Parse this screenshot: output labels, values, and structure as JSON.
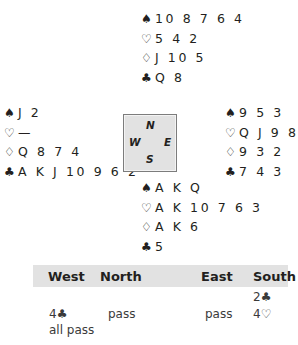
{
  "suits": {
    "spades": "♠",
    "hearts": "♡",
    "diamonds": "♢",
    "clubs": "♣"
  },
  "hands": {
    "north": {
      "spades": "10 8 7 6 4",
      "hearts": "5 4 2",
      "diamonds": "J 10 5",
      "clubs": "Q 8"
    },
    "west": {
      "spades": "J 2",
      "hearts": "—",
      "diamonds": "Q 8 7 4",
      "clubs": "A K J 10 9 6 2"
    },
    "east": {
      "spades": "9 5 3",
      "hearts": "Q J 9 8",
      "diamonds": "9 3 2",
      "clubs": "7 4 3"
    },
    "south": {
      "spades": "A K Q",
      "hearts": "A K 10 7 6 3",
      "diamonds": "A K 6",
      "clubs": "5"
    }
  },
  "compass": {
    "n": "N",
    "w": "W",
    "e": "E",
    "s": "S"
  },
  "colors": {
    "compass_bg": "#e2e2e2",
    "header_bg": "#e2e2e2",
    "text": "#231f20"
  },
  "auction": {
    "headers": [
      "West",
      "North",
      "East",
      "South"
    ],
    "rows": [
      [
        "",
        "",
        "",
        "2♣"
      ],
      [
        "4♣",
        "pass",
        "pass",
        "4♡"
      ],
      [
        "all pass",
        "",
        "",
        ""
      ]
    ]
  }
}
